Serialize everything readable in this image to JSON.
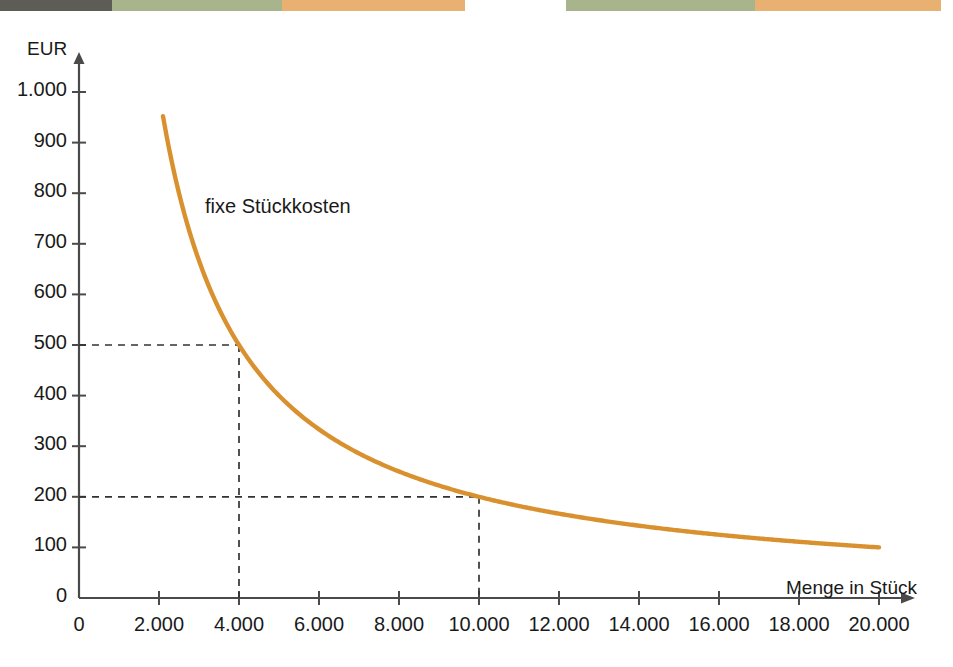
{
  "topband": {
    "name": "page-edge-colour-band",
    "segments": [
      {
        "color": "#5d5d55",
        "width": 112
      },
      {
        "color": "#a8b58c",
        "width": 170
      },
      {
        "color": "#e8b172",
        "width": 183
      },
      {
        "color": "#ffffff",
        "width": 101
      },
      {
        "color": "#a8b58c",
        "width": 189
      },
      {
        "color": "#e8b172",
        "width": 186
      },
      {
        "color": "#ffffff",
        "width": 12
      }
    ]
  },
  "chart_data": {
    "type": "line",
    "title": "",
    "subtitle": "",
    "xlabel": "Menge in Stück",
    "ylabel": "EUR",
    "xlim": [
      0,
      20000
    ],
    "ylim": [
      0,
      1000
    ],
    "grid": false,
    "legend_position": "inline-annotation",
    "series": [
      {
        "name": "fixe Stückkosten",
        "color": "#d9912f",
        "formula": "y = 2.000.000 / x",
        "x": [
          2100,
          2500,
          3000,
          3500,
          4000,
          4500,
          5000,
          6000,
          7000,
          8000,
          9000,
          10000,
          11000,
          12000,
          13000,
          14000,
          15000,
          16000,
          17000,
          18000,
          19000,
          20000
        ],
        "y": [
          952,
          800,
          667,
          571,
          500,
          444,
          400,
          333,
          286,
          250,
          222,
          200,
          182,
          167,
          154,
          143,
          133,
          125,
          118,
          111,
          105,
          100
        ]
      }
    ],
    "annotations": [
      {
        "label": "fixe Stückkosten",
        "x": 4000,
        "y": 640,
        "kind": "series-label"
      }
    ],
    "guide_lines": [
      {
        "x": 4000,
        "y": 500,
        "style": "dashed",
        "color": "#333333"
      },
      {
        "x": 10000,
        "y": 200,
        "style": "dashed",
        "color": "#333333"
      }
    ],
    "y_ticks": [
      {
        "value": 0,
        "label": "0"
      },
      {
        "value": 100,
        "label": "100"
      },
      {
        "value": 200,
        "label": "200"
      },
      {
        "value": 300,
        "label": "300"
      },
      {
        "value": 400,
        "label": "400"
      },
      {
        "value": 500,
        "label": "500"
      },
      {
        "value": 600,
        "label": "600"
      },
      {
        "value": 700,
        "label": "700"
      },
      {
        "value": 800,
        "label": "800"
      },
      {
        "value": 900,
        "label": "900"
      },
      {
        "value": 1000,
        "label": "1.000"
      }
    ],
    "x_ticks": [
      {
        "value": 0,
        "label": "0"
      },
      {
        "value": 2000,
        "label": "2.000"
      },
      {
        "value": 4000,
        "label": "4.000"
      },
      {
        "value": 6000,
        "label": "6.000"
      },
      {
        "value": 8000,
        "label": "8.000"
      },
      {
        "value": 10000,
        "label": "10.000"
      },
      {
        "value": 12000,
        "label": "12.000"
      },
      {
        "value": 14000,
        "label": "14.000"
      },
      {
        "value": 16000,
        "label": "16.000"
      },
      {
        "value": 18000,
        "label": "18.000"
      },
      {
        "value": 20000,
        "label": "20.000"
      }
    ],
    "axis_color": "#4a4a4a",
    "background": "#ffffff"
  }
}
